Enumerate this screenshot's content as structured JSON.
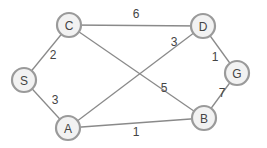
{
  "diagram": {
    "type": "weighted-undirected-graph",
    "colors": {
      "background": "#ffffff",
      "edge": "#8a8a8a",
      "node_fill": "#f2f2f2",
      "node_stroke": "#9a9a9a",
      "text": "#444444"
    },
    "nodes": [
      {
        "id": "S",
        "label": "S",
        "x": 24,
        "y": 80
      },
      {
        "id": "C",
        "label": "C",
        "x": 69,
        "y": 25
      },
      {
        "id": "A",
        "label": "A",
        "x": 68,
        "y": 128
      },
      {
        "id": "D",
        "label": "D",
        "x": 203,
        "y": 26
      },
      {
        "id": "B",
        "label": "B",
        "x": 204,
        "y": 118
      },
      {
        "id": "G",
        "label": "G",
        "x": 237,
        "y": 73
      }
    ],
    "edges": [
      {
        "from": "C",
        "to": "D",
        "weight": "6",
        "label_x": 136,
        "label_y": 14
      },
      {
        "from": "S",
        "to": "C",
        "weight": "2",
        "label_x": 53,
        "label_y": 55
      },
      {
        "from": "C",
        "to": "B",
        "weight": "5",
        "label_x": 164,
        "label_y": 88
      },
      {
        "from": "A",
        "to": "D",
        "weight": "3",
        "label_x": 174,
        "label_y": 42
      },
      {
        "from": "D",
        "to": "G",
        "weight": "1",
        "label_x": 215,
        "label_y": 57
      },
      {
        "from": "S",
        "to": "A",
        "weight": "3",
        "label_x": 55,
        "label_y": 100
      },
      {
        "from": "A",
        "to": "B",
        "weight": "1",
        "label_x": 136,
        "label_y": 132
      },
      {
        "from": "B",
        "to": "G",
        "weight": "7",
        "label_x": 222,
        "label_y": 93
      }
    ]
  }
}
